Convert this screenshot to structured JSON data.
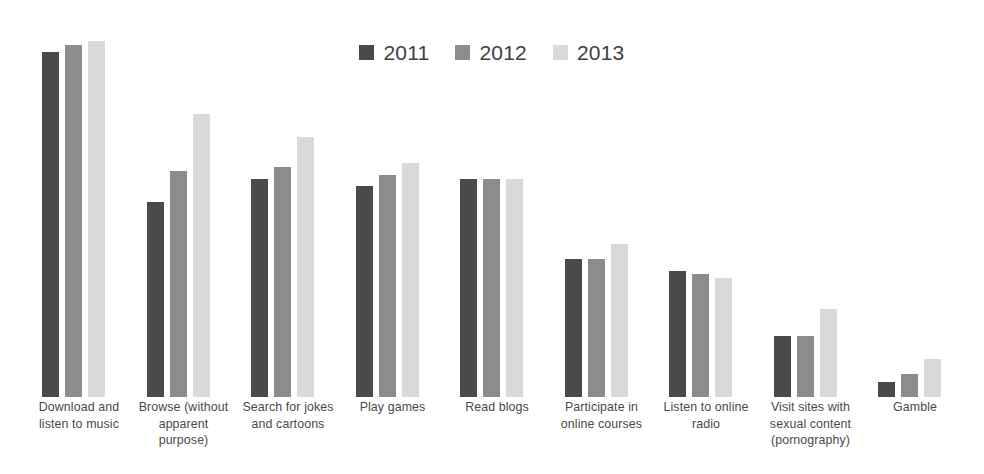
{
  "chart": {
    "title": "",
    "legend_position": "top-center"
  },
  "legend": {
    "entries": [
      {
        "label": "2011",
        "color": "#4a4a4a",
        "swatch_name": "legend-swatch-2011"
      },
      {
        "label": "2012",
        "color": "#8c8c8c",
        "swatch_name": "legend-swatch-2012"
      },
      {
        "label": "2013",
        "color": "#d9d9d9",
        "swatch_name": "legend-swatch-2013"
      }
    ]
  },
  "chart_data": {
    "type": "bar",
    "title": "",
    "xlabel": "",
    "ylabel": "",
    "grid": false,
    "legend_position": "top-center",
    "ylim": [
      0,
      100
    ],
    "axis_visible": false,
    "categories": [
      "Download and listen to music",
      "Browse (without apparent purpose)",
      "Search for jokes and cartoons",
      "Play games",
      "Read blogs",
      "Participate in online courses",
      "Listen to online radio",
      "Visit sites with sexual content (pornography)",
      "Gamble"
    ],
    "category_label_lines": [
      [
        "Download and",
        "listen to music"
      ],
      [
        "Browse (without",
        "apparent",
        "purpose)"
      ],
      [
        "Search for jokes",
        "and cartoons"
      ],
      [
        "Play games"
      ],
      [
        "Read blogs"
      ],
      [
        "Participate in",
        "online courses"
      ],
      [
        "Listen to online",
        "radio"
      ],
      [
        "Visit sites with",
        "sexual content",
        "(pornography)"
      ],
      [
        "Gamble"
      ]
    ],
    "series": [
      {
        "name": "2011",
        "color": "#4a4a4a",
        "values": [
          90,
          51,
          57,
          55,
          57,
          36,
          33,
          16,
          4
        ]
      },
      {
        "name": "2012",
        "color": "#8c8c8c",
        "values": [
          92,
          59,
          60,
          58,
          57,
          36,
          32,
          16,
          6
        ]
      },
      {
        "name": "2013",
        "color": "#d9d9d9",
        "values": [
          93,
          74,
          68,
          61,
          57,
          40,
          31,
          23,
          10
        ]
      }
    ]
  }
}
